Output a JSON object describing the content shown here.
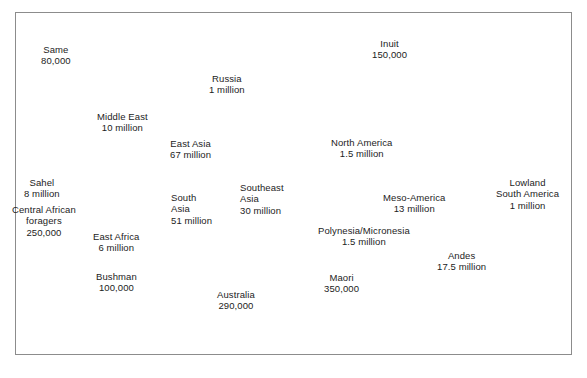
{
  "figure": {
    "kind": "world-map-thematic",
    "caption": "",
    "frame_border_color": "#8c8c8c",
    "land_outline_color": "#4d4d4d",
    "region_fill_color": "#a9a9a9",
    "background_color": "#ffffff",
    "text_color": "#1c1c1c"
  },
  "regions": [
    {
      "id": "same",
      "name": "Same",
      "population": "80,000",
      "align": "center"
    },
    {
      "id": "russia",
      "name": "Russia",
      "population": "1 million",
      "align": "center"
    },
    {
      "id": "inuit",
      "name": "Inuit",
      "population": "150,000",
      "align": "center"
    },
    {
      "id": "middle-east",
      "name": "Middle East",
      "population": "10 million",
      "align": "center"
    },
    {
      "id": "east-asia",
      "name": "East Asia",
      "population": "67 million",
      "align": "center"
    },
    {
      "id": "north-america",
      "name": "North America",
      "population": "1.5 million",
      "align": "center"
    },
    {
      "id": "sahel",
      "name": "Sahel",
      "population": "8 million",
      "align": "center"
    },
    {
      "id": "south-asia",
      "name": "South\nAsia",
      "population": "51 million",
      "align": "left"
    },
    {
      "id": "southeast-asia",
      "name": "Southeast\nAsia",
      "population": "30 million",
      "align": "left"
    },
    {
      "id": "lowland-south-america",
      "name": "Lowland\nSouth America",
      "population": "1 million",
      "align": "center"
    },
    {
      "id": "central-african-foragers",
      "name": "Central African\nforagers",
      "population": "250,000",
      "align": "center"
    },
    {
      "id": "meso-america",
      "name": "Meso-America",
      "population": "13 million",
      "align": "center"
    },
    {
      "id": "east-africa",
      "name": "East Africa",
      "population": "6 million",
      "align": "center"
    },
    {
      "id": "polynesia-micronesia",
      "name": "Polynesia/Micronesia",
      "population": "1.5 million",
      "align": "center"
    },
    {
      "id": "andes",
      "name": "Andes",
      "population": "17.5 million",
      "align": "center"
    },
    {
      "id": "bushman",
      "name": "Bushman",
      "population": "100,000",
      "align": "center"
    },
    {
      "id": "maori",
      "name": "Maori",
      "population": "350,000",
      "align": "center"
    },
    {
      "id": "australia",
      "name": "Australia",
      "population": "290,000",
      "align": "center"
    }
  ],
  "labels": {
    "same_name": "Same",
    "same_pop": "80,000",
    "russia_name": "Russia",
    "russia_pop": "1 million",
    "inuit_name": "Inuit",
    "inuit_pop": "150,000",
    "middle_east_name": "Middle East",
    "middle_east_pop": "10 million",
    "east_asia_name": "East Asia",
    "east_asia_pop": "67 million",
    "north_america_name": "North America",
    "north_america_pop": "1.5 million",
    "sahel_name": "Sahel",
    "sahel_pop": "8 million",
    "south_asia_name_1": "South",
    "south_asia_name_2": "Asia",
    "south_asia_pop": "51 million",
    "southeast_asia_name_1": "Southeast",
    "southeast_asia_name_2": "Asia",
    "southeast_asia_pop": "30 million",
    "lowland_sa_name_1": "Lowland",
    "lowland_sa_name_2": "South America",
    "lowland_sa_pop": "1 million",
    "caf_name_1": "Central African",
    "caf_name_2": "foragers",
    "caf_pop": "250,000",
    "meso_america_name": "Meso-America",
    "meso_america_pop": "13 million",
    "east_africa_name": "East Africa",
    "east_africa_pop": "6 million",
    "polynesia_name": "Polynesia/Micronesia",
    "polynesia_pop": "1.5 million",
    "andes_name": "Andes",
    "andes_pop": "17.5 million",
    "bushman_name": "Bushman",
    "bushman_pop": "100,000",
    "maori_name": "Maori",
    "maori_pop": "350,000",
    "australia_name": "Australia",
    "australia_pop": "290,000"
  }
}
